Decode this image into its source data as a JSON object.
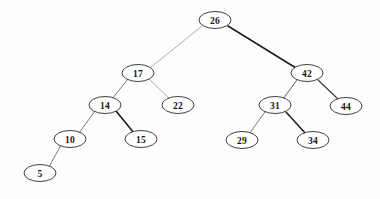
{
  "diagram": {
    "type": "binary-search-tree",
    "background_color": "#fdfdfd",
    "node_fill": "#ffffff",
    "node_stroke": "#2a2a2a",
    "edge_color_dark": "#1c1c1c",
    "edge_color_light": "#8c8c8c",
    "node_rx": 16,
    "node_ry": 8.5
  },
  "nodes": [
    {
      "id": "n26",
      "value": "26",
      "x": 215,
      "y": 20,
      "level": 0,
      "role": "root"
    },
    {
      "id": "n17",
      "value": "17",
      "x": 138,
      "y": 73,
      "level": 1,
      "role": "left-child"
    },
    {
      "id": "n42",
      "value": "42",
      "x": 307,
      "y": 73,
      "level": 1,
      "role": "right-child"
    },
    {
      "id": "n14",
      "value": "14",
      "x": 105,
      "y": 105,
      "level": 2,
      "role": "left-child"
    },
    {
      "id": "n22",
      "value": "22",
      "x": 178,
      "y": 105,
      "level": 2,
      "role": "right-child"
    },
    {
      "id": "n31",
      "value": "31",
      "x": 275,
      "y": 105,
      "level": 2,
      "role": "left-child"
    },
    {
      "id": "n44",
      "value": "44",
      "x": 346,
      "y": 106,
      "level": 2,
      "role": "right-child"
    },
    {
      "id": "n10",
      "value": "10",
      "x": 70,
      "y": 139,
      "level": 3,
      "role": "left-child"
    },
    {
      "id": "n15",
      "value": "15",
      "x": 141,
      "y": 139,
      "level": 3,
      "role": "right-child"
    },
    {
      "id": "n29",
      "value": "29",
      "x": 242,
      "y": 140,
      "level": 3,
      "role": "left-child"
    },
    {
      "id": "n34",
      "value": "34",
      "x": 313,
      "y": 140,
      "level": 3,
      "role": "right-child"
    },
    {
      "id": "n5",
      "value": "5",
      "x": 40,
      "y": 173,
      "level": 4,
      "role": "left-child"
    }
  ],
  "edges": [
    {
      "id": "e26-17",
      "from": "n26",
      "to": "n17",
      "side": "left",
      "x1": 202,
      "y1": 26,
      "x2": 150,
      "y2": 68,
      "color": "#9a9a9a",
      "width": 0.8
    },
    {
      "id": "e26-42",
      "from": "n26",
      "to": "n42",
      "side": "right",
      "x1": 228,
      "y1": 26,
      "x2": 296,
      "y2": 68,
      "color": "#1c1c1c",
      "width": 1.5
    },
    {
      "id": "e17-14",
      "from": "n17",
      "to": "n14",
      "side": "left",
      "x1": 128,
      "y1": 79,
      "x2": 112,
      "y2": 99,
      "color": "#6e6e6e",
      "width": 0.9
    },
    {
      "id": "e17-22",
      "from": "n17",
      "to": "n22",
      "side": "right",
      "x1": 149,
      "y1": 79,
      "x2": 170,
      "y2": 99,
      "color": "#a5a5a5",
      "width": 0.9
    },
    {
      "id": "e42-31",
      "from": "n42",
      "to": "n31",
      "side": "left",
      "x1": 297,
      "y1": 80,
      "x2": 283,
      "y2": 99,
      "color": "#5c5c5c",
      "width": 1.0
    },
    {
      "id": "e42-44",
      "from": "n42",
      "to": "n44",
      "side": "right",
      "x1": 318,
      "y1": 80,
      "x2": 339,
      "y2": 100,
      "color": "#3a3a3a",
      "width": 1.1
    },
    {
      "id": "e14-10",
      "from": "n14",
      "to": "n10",
      "side": "left",
      "x1": 95,
      "y1": 111,
      "x2": 79,
      "y2": 133,
      "color": "#6a6a6a",
      "width": 0.9
    },
    {
      "id": "e14-15",
      "from": "n14",
      "to": "n15",
      "side": "right",
      "x1": 116,
      "y1": 111,
      "x2": 134,
      "y2": 133,
      "color": "#1c1c1c",
      "width": 1.6
    },
    {
      "id": "e31-29",
      "from": "n31",
      "to": "n29",
      "side": "left",
      "x1": 265,
      "y1": 112,
      "x2": 249,
      "y2": 134,
      "color": "#6a6a6a",
      "width": 0.9
    },
    {
      "id": "e31-34",
      "from": "n31",
      "to": "n34",
      "side": "right",
      "x1": 286,
      "y1": 112,
      "x2": 306,
      "y2": 134,
      "color": "#1c1c1c",
      "width": 1.5
    },
    {
      "id": "e10-5",
      "from": "n10",
      "to": "n5",
      "side": "left",
      "x1": 61,
      "y1": 145,
      "x2": 49,
      "y2": 167,
      "color": "#6a6a6a",
      "width": 0.9
    }
  ]
}
